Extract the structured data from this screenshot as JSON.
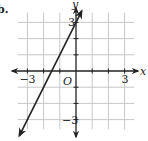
{
  "problem_label": "b.",
  "chart_data": {
    "type": "line",
    "title": "",
    "xlabel": "x",
    "ylabel": "y",
    "origin_label": "O",
    "xlim": [
      -4,
      4
    ],
    "ylim": [
      -4,
      4
    ],
    "grid": true,
    "x_tick_labels": [
      {
        "value": -3,
        "label": "-3"
      },
      {
        "value": 3,
        "label": "3"
      }
    ],
    "y_tick_labels": [
      {
        "value": 3,
        "label": "3"
      },
      {
        "value": -3,
        "label": "-3"
      }
    ],
    "series": [
      {
        "name": "y = 2x + 3",
        "slope": 2,
        "intercept": 3,
        "x": [
          -3.5,
          0.35
        ],
        "y": [
          -4,
          3.7
        ],
        "arrows": "both"
      }
    ]
  },
  "colors": {
    "grid": "#c8c8c8",
    "axis": "#222222",
    "line": "#222222"
  }
}
